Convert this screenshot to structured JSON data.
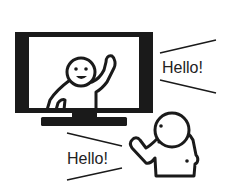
{
  "illustration": {
    "tv_speech": "Hello!",
    "viewer_speech": "Hello!"
  },
  "colors": {
    "ink": "#1a1a1a",
    "background": "#ffffff",
    "screen": "#ffffff"
  },
  "icons": {
    "tv": "television-icon",
    "tv_person": "waving-person-icon",
    "viewer_person": "waving-person-icon"
  }
}
